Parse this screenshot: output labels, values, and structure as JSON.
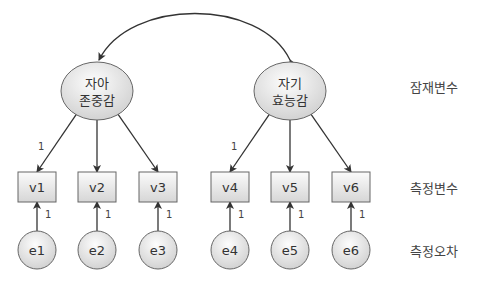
{
  "latents": [
    {
      "id": "F1",
      "line1": "자아",
      "line2": "존중감",
      "cx": 97,
      "cy": 91
    },
    {
      "id": "F2",
      "line1": "자기",
      "line2": "효능감",
      "cx": 290,
      "cy": 91
    }
  ],
  "observed": [
    {
      "label": "v1",
      "cx": 37
    },
    {
      "label": "v2",
      "cx": 97
    },
    {
      "label": "v3",
      "cx": 158
    },
    {
      "label": "v4",
      "cx": 230
    },
    {
      "label": "v5",
      "cx": 290
    },
    {
      "label": "v6",
      "cx": 351
    }
  ],
  "errors": [
    {
      "label": "e1",
      "cx": 37
    },
    {
      "label": "e2",
      "cx": 97
    },
    {
      "label": "e3",
      "cx": 158
    },
    {
      "label": "e4",
      "cx": 230
    },
    {
      "label": "e5",
      "cx": 290
    },
    {
      "label": "e6",
      "cx": 351
    }
  ],
  "loading_fixed_label": "1",
  "error_path_label": "1",
  "legend": {
    "latent": "잠재변수",
    "observed": "측정변수",
    "error": "측정오차"
  },
  "colors": {
    "stroke": "#5a5a5a",
    "arrow": "#333333",
    "fill_light": "#fafafa",
    "fill_dark": "#d4d4d4",
    "text": "#333333"
  }
}
